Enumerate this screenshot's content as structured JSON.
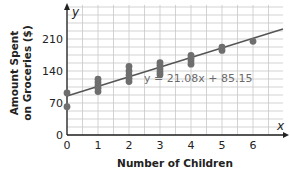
{
  "chart_data": {
    "type": "scatter",
    "title": "",
    "xlabel": "Number of Children",
    "ylabel_lines": [
      "Amount Spent",
      "on Groceries ($)"
    ],
    "ylabel": "Amount Spent on Groceries ($)",
    "x_axis_letter": "x",
    "y_axis_letter": "y",
    "xlim": [
      0,
      7
    ],
    "ylim": [
      0,
      245
    ],
    "x_ticks": [
      0,
      1,
      2,
      3,
      4,
      5,
      6
    ],
    "y_ticks": [
      0,
      70,
      140,
      210
    ],
    "grid": true,
    "grid_x_step": 0.5,
    "grid_y_step": 17.5,
    "points": [
      {
        "x": 0,
        "y": 92
      },
      {
        "x": 0,
        "y": 62
      },
      {
        "x": 1,
        "y": 95
      },
      {
        "x": 1,
        "y": 102
      },
      {
        "x": 1,
        "y": 108
      },
      {
        "x": 1,
        "y": 115
      },
      {
        "x": 1,
        "y": 122
      },
      {
        "x": 2,
        "y": 117
      },
      {
        "x": 2,
        "y": 124
      },
      {
        "x": 2,
        "y": 131
      },
      {
        "x": 2,
        "y": 140
      },
      {
        "x": 2,
        "y": 150
      },
      {
        "x": 3,
        "y": 132
      },
      {
        "x": 3,
        "y": 138
      },
      {
        "x": 3,
        "y": 145
      },
      {
        "x": 3,
        "y": 152
      },
      {
        "x": 3,
        "y": 158
      },
      {
        "x": 4,
        "y": 155
      },
      {
        "x": 4,
        "y": 162
      },
      {
        "x": 4,
        "y": 168
      },
      {
        "x": 4,
        "y": 174
      },
      {
        "x": 5,
        "y": 185
      },
      {
        "x": 5,
        "y": 192
      },
      {
        "x": 6,
        "y": 205
      }
    ],
    "regression": {
      "slope": 21.08,
      "intercept": 85.15,
      "label": "y = 21.08x + 85.15"
    },
    "colors": {
      "grid": "#c8c8c8",
      "axis": "#222222",
      "point": "#6e6e6e",
      "line": "#555555",
      "equation": "#6b6b6b"
    }
  }
}
